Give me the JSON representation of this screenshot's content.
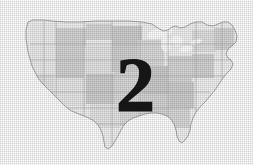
{
  "figure": {
    "kind": "thematic-map-figure",
    "background_color": "#ffffff",
    "description_title": "United States map with overlaid numeral",
    "map": {
      "region_name": "Contiguous United States",
      "outline_color": "#9a9a9a",
      "state_border_color": "#b4b4b4",
      "fill_light": "#f0f0f0",
      "fill_medium": "#d2d2d2",
      "fill_dark": "#bdbdbd",
      "water_color": "#ffffff",
      "texture": "halftone-dither"
    },
    "overlay": {
      "numeral": "2",
      "numeral_color": "#161616",
      "numeral_style": "bold-serif"
    }
  }
}
